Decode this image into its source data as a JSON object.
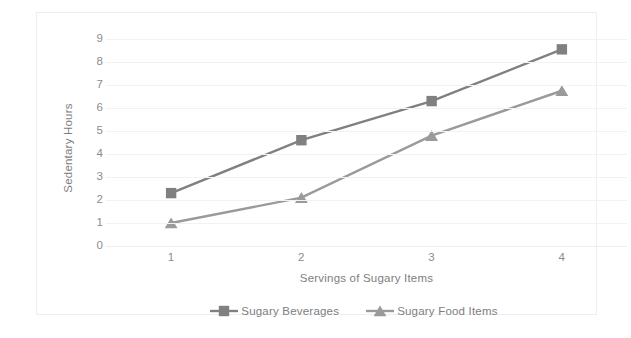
{
  "chart_data": {
    "type": "line",
    "title": "",
    "subtitle": "",
    "xlabel": "Servings of Sugary Items",
    "ylabel": "Sedentary Hours",
    "categories": [
      "1",
      "2",
      "3",
      "4"
    ],
    "x_tick_labels": [
      "1",
      "2",
      "3",
      "4"
    ],
    "y_tick_labels": [
      "0",
      "1",
      "2",
      "3",
      "4",
      "5",
      "6",
      "7",
      "8",
      "9"
    ],
    "ylim": [
      0,
      9
    ],
    "grid": "horizontal",
    "legend_position": "bottom-center",
    "series": [
      {
        "name": "Sugary Beverages",
        "marker": "square",
        "color": "#808080",
        "values": [
          2.3,
          4.6,
          6.3,
          8.55
        ]
      },
      {
        "name": "Sugary Food Items",
        "marker": "triangle",
        "color": "#9a9a9a",
        "values": [
          1.0,
          2.1,
          4.8,
          6.75
        ]
      }
    ]
  },
  "legend": {
    "entries": [
      {
        "label": "Sugary Beverages"
      },
      {
        "label": "Sugary Food Items"
      }
    ]
  },
  "colors": {
    "series_beverages": "#808080",
    "series_food": "#9a9a9a",
    "gridline": "#f1f2f3",
    "frame_border": "#eceff1",
    "tick_text": "#8c8c8c",
    "axis_title_text": "#7e7e7e",
    "plot_background": "#ffffff"
  }
}
